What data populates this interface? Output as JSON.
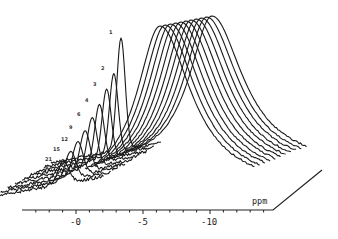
{
  "chart_data": {
    "type": "line",
    "subtype": "stacked-3d-waterfall-nmr-spectra",
    "title": "",
    "xlabel": "ppm",
    "ylabel": "",
    "x_ticks": [
      {
        "value": 0,
        "label": "-0"
      },
      {
        "value": -5,
        "label": "-5"
      },
      {
        "value": -10,
        "label": "-10"
      }
    ],
    "xlim": [
      3.5,
      -14.5
    ],
    "minor_tick_step": 1,
    "grid": false,
    "legend": "none",
    "series_labels": [
      "1",
      "2",
      "3",
      "4",
      "6",
      "9",
      "12",
      "15",
      "21"
    ],
    "sharp_peak": {
      "position_ppm": -2.3,
      "relative_heights": [
        1.0,
        0.72,
        0.62,
        0.52,
        0.44,
        0.36,
        0.3,
        0.25,
        0.2
      ],
      "width_ppm": 0.35
    },
    "broad_peak": {
      "position_ppm": -6.5,
      "count": 11,
      "relative_height": 1.0,
      "width_ppm": 2.3
    },
    "series": [
      {
        "name": "1",
        "sharp_height": 1.0
      },
      {
        "name": "2",
        "sharp_height": 0.72
      },
      {
        "name": "3",
        "sharp_height": 0.62
      },
      {
        "name": "4",
        "sharp_height": 0.52
      },
      {
        "name": "6",
        "sharp_height": 0.44
      },
      {
        "name": "9",
        "sharp_height": 0.36
      },
      {
        "name": "12",
        "sharp_height": 0.3
      },
      {
        "name": "15",
        "sharp_height": 0.25
      },
      {
        "name": "21",
        "sharp_height": 0.2
      }
    ]
  },
  "axis": {
    "unit": "ppm",
    "tick_labels": [
      "-0",
      "-5",
      "-10"
    ]
  }
}
